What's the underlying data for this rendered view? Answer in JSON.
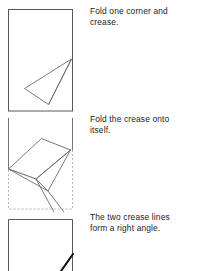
{
  "document": {
    "kind": "paper-folding-instructions",
    "panel_count": 3
  },
  "steps": [
    {
      "index": 1,
      "caption": "Fold one corner and\ncrease.",
      "figure_name": "fold-one-corner-figure",
      "description": "Portrait rectangle of paper with one corner folded over to form a narrow triangular flap; the original right edge shown as a dashed ghost line."
    },
    {
      "index": 2,
      "caption": "Fold the crease onto\nitself.",
      "figure_name": "fold-crease-onto-itself-figure",
      "description": "The same sheet rotated, with a second fold bringing the first crease onto itself; ghost outline of the original sheet shown dashed."
    },
    {
      "index": 3,
      "caption": "The two crease lines\nform a right angle.",
      "figure_name": "right-angle-creases-figure",
      "description": "Unfolded sheet showing a single heavy crease line meeting the corner, indicating the two creases form a right angle."
    }
  ],
  "colors": {
    "paper_edge": "#585858",
    "fold_line": "#6b6b6b",
    "ghost_edge": "#b0b0b0",
    "heavy_crease": "#101010",
    "text": "#232323",
    "background": "#ffffff"
  }
}
